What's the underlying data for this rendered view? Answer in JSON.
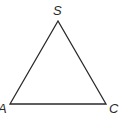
{
  "diagram": {
    "type": "triangle",
    "vertices": [
      {
        "label": "S",
        "x": 58,
        "y": 21
      },
      {
        "label": "A",
        "x": 10,
        "y": 104
      },
      {
        "label": "C",
        "x": 106,
        "y": 104
      }
    ],
    "stroke_color": "#2a2a2a"
  }
}
